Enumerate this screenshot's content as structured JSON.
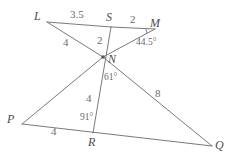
{
  "figure": {
    "type": "geometry-diagram",
    "stroke_color": "#7a7a7c",
    "label_color": "#58585a",
    "background": "#ffffff",
    "vertices": [
      {
        "name": "L",
        "label": "L",
        "x": 47,
        "y": 22,
        "label_x": 34,
        "label_y": 10
      },
      {
        "name": "S",
        "label": "S",
        "x": 111,
        "y": 27,
        "label_x": 106,
        "label_y": 11
      },
      {
        "name": "M",
        "label": "M",
        "x": 155,
        "y": 29,
        "label_x": 150,
        "label_y": 17
      },
      {
        "name": "N",
        "label": "N",
        "x": 103,
        "y": 57,
        "label_x": 108,
        "label_y": 53
      },
      {
        "name": "P",
        "label": "P",
        "x": 22,
        "y": 124,
        "label_x": 7,
        "label_y": 113
      },
      {
        "name": "R",
        "label": "R",
        "x": 93,
        "y": 133,
        "label_x": 88,
        "label_y": 136
      },
      {
        "name": "Q",
        "label": "Q",
        "x": 212,
        "y": 146,
        "label_x": 215,
        "label_y": 139
      }
    ],
    "segments": [
      {
        "name": "L-S",
        "from": "L",
        "to": "S"
      },
      {
        "name": "S-M",
        "from": "S",
        "to": "M"
      },
      {
        "name": "L-N",
        "from": "L",
        "to": "N"
      },
      {
        "name": "S-R",
        "from": "S",
        "to": "R"
      },
      {
        "name": "M-N",
        "from": "M",
        "to": "N"
      },
      {
        "name": "N-Q",
        "from": "N",
        "to": "Q"
      },
      {
        "name": "N-P",
        "from": "N",
        "to": "P"
      },
      {
        "name": "P-Q",
        "from": "P",
        "to": "Q"
      }
    ],
    "measures": [
      {
        "name": "length-LS",
        "text": "3.5",
        "x": 70,
        "y": 9
      },
      {
        "name": "length-SM",
        "text": "2",
        "x": 130,
        "y": 14
      },
      {
        "name": "length-LN",
        "text": "4",
        "x": 63,
        "y": 37
      },
      {
        "name": "length-SN",
        "text": "2",
        "x": 97,
        "y": 35
      },
      {
        "name": "length-NR",
        "text": "4",
        "x": 86,
        "y": 93
      },
      {
        "name": "length-NQ",
        "text": "8",
        "x": 155,
        "y": 88
      },
      {
        "name": "length-PR",
        "text": "4",
        "x": 51,
        "y": 126
      }
    ],
    "angles": [
      {
        "name": "angle-at-M",
        "text": "44.5°",
        "x": 136,
        "y": 38
      },
      {
        "name": "angle-at-N",
        "text": "61°",
        "x": 104,
        "y": 73
      },
      {
        "name": "angle-at-R",
        "text": "91°",
        "x": 80,
        "y": 113
      }
    ]
  }
}
